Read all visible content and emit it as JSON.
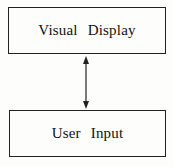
{
  "diagram": {
    "nodes": [
      {
        "id": "visual-display",
        "label": "Visual Display"
      },
      {
        "id": "user-input",
        "label": "User Input"
      }
    ],
    "edges": [
      {
        "from": "visual-display",
        "to": "user-input",
        "type": "bidirectional-arrow"
      }
    ]
  }
}
